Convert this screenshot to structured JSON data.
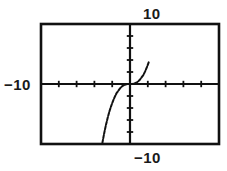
{
  "chart_data": {
    "type": "line",
    "title": "",
    "xlabel": "",
    "ylabel": "",
    "grid": false,
    "legend": null,
    "xlim": [
      -10,
      10
    ],
    "ylim": [
      -10,
      10
    ],
    "xticks": [
      -10,
      -8,
      -6,
      -4,
      -2,
      0,
      2,
      4,
      6,
      8,
      10
    ],
    "yticks": [
      -10,
      -8,
      -6,
      -4,
      -2,
      0,
      2,
      4,
      6,
      8,
      10
    ],
    "series": [
      {
        "name": "y = x^3",
        "x": [
          -3.1,
          -2.9,
          -2.7,
          -2.5,
          -2.3,
          -2.1,
          -1.9,
          -1.7,
          -1.5,
          -1.3,
          -1.1,
          -0.9,
          -0.7,
          -0.5,
          -0.3,
          -0.1,
          0.1,
          0.3,
          0.5,
          0.7,
          0.9,
          1.1,
          1.3,
          1.5,
          1.7,
          1.9,
          2.1
        ],
        "y": [
          -9.8,
          -8.2,
          -6.8,
          -5.6,
          -4.5,
          -3.6,
          -2.8,
          -2.1,
          -1.5,
          -1.1,
          -0.7,
          -0.4,
          -0.2,
          -0.1,
          -0.02,
          0.0,
          0.0,
          0.02,
          0.1,
          0.2,
          0.4,
          0.7,
          1.1,
          1.5,
          2.1,
          2.8,
          3.6
        ]
      }
    ],
    "annotations": []
  },
  "viewport": {
    "top_label": "10",
    "left_label": "−10",
    "bottom_label": "−10",
    "frame_color": "#111111",
    "axis_color": "#111111",
    "curve_color": "#111111",
    "background_color": "#ffffff"
  },
  "icons": {
    "graph": "function-graph-icon"
  }
}
